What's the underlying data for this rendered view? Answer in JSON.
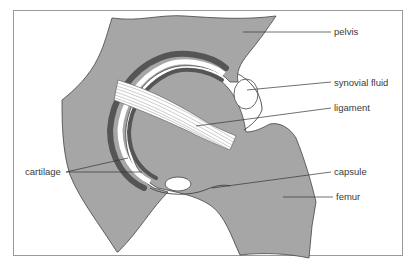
{
  "diagram": {
    "labels": {
      "pelvis": "pelvis",
      "synovial_fluid": "synovial fluid",
      "ligament": "ligament",
      "cartilage": "cartilage",
      "capsule": "capsule",
      "femur": "femur"
    },
    "colors": {
      "bone": "#a6a6a6",
      "cartilage_dark": "#555555",
      "fluid": "#ffffff",
      "frame": "#9a9a9a",
      "text": "#3a3a3a"
    }
  }
}
